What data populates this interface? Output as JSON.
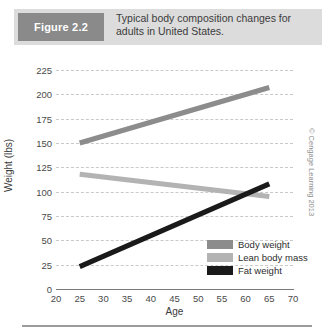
{
  "figure": {
    "tag": "Figure 2.2",
    "caption": "Typical body composition changes for adults in United States."
  },
  "credit": "© Cengage Learning 2013",
  "colors": {
    "body_weight": "#8c8c8c",
    "lean_body_mass": "#b3b3b3",
    "fat_weight": "#1a1a1a",
    "gridline": "#c9c9c9",
    "axis": "#7a7a7a",
    "header_band": "#dcdcdc",
    "header_tag": "#8a8a8a"
  },
  "chart_data": {
    "type": "line",
    "title": "Typical body composition changes for adults in United States.",
    "xlabel": "Age",
    "ylabel": "Weight (lbs)",
    "xlim": [
      20,
      70
    ],
    "ylim": [
      0,
      225
    ],
    "xticks": [
      20,
      25,
      30,
      35,
      40,
      45,
      50,
      55,
      60,
      65,
      70
    ],
    "yticks": [
      0,
      25,
      50,
      75,
      100,
      125,
      150,
      175,
      200,
      225
    ],
    "grid": "horizontal-dashed",
    "legend_position": "inside-bottom-right",
    "series": [
      {
        "name": "Body weight",
        "color": "#8c8c8c",
        "x": [
          25,
          65
        ],
        "values": [
          150,
          207
        ]
      },
      {
        "name": "Lean body mass",
        "color": "#b3b3b3",
        "x": [
          25,
          65
        ],
        "values": [
          118,
          95
        ]
      },
      {
        "name": "Fat weight",
        "color": "#1a1a1a",
        "x": [
          25,
          65
        ],
        "values": [
          23,
          108
        ]
      }
    ]
  }
}
